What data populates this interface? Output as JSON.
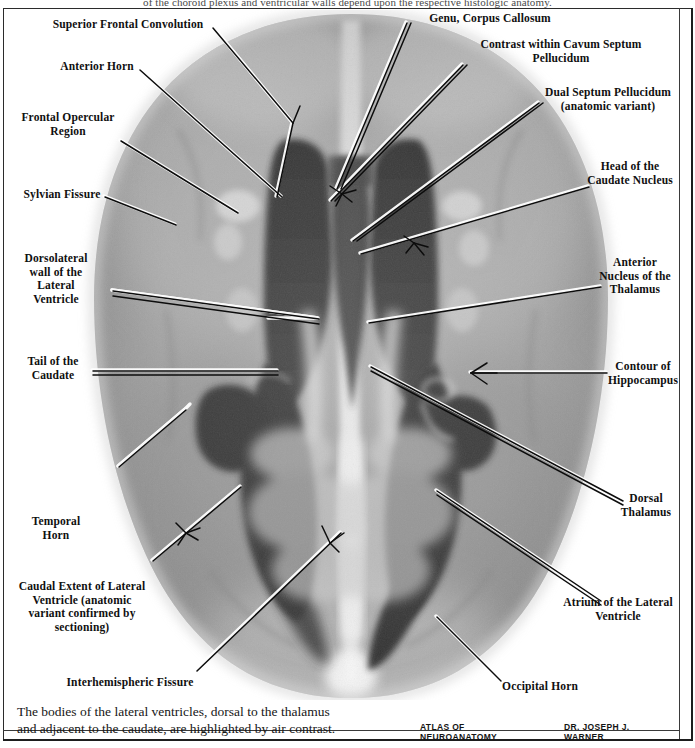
{
  "page": {
    "top_running_text": "of the choroid plexus and ventricular walls depend upon the respective histologic anatomy.",
    "width": 695,
    "height": 748
  },
  "figure": {
    "type": "pneumoencephalogram-axial-brain-radiograph",
    "colors": {
      "background": "#ffffff",
      "brain_parenchyma": "#9a9a9a",
      "ventricle_air": "#2c2c2c",
      "bright_contrast": "#f2f2f2",
      "label_text": "#101010",
      "leader_line": "#0c0c0c",
      "leader_halo": "#ffffff",
      "frame": "#1d1d1d"
    }
  },
  "labels": [
    {
      "id": "superior-frontal-convolution",
      "text": "Superior Frontal Convolution"
    },
    {
      "id": "anterior-horn",
      "text": "Anterior Horn"
    },
    {
      "id": "frontal-opercular-region",
      "text": "Frontal Opercular\nRegion"
    },
    {
      "id": "sylvian-fissure",
      "text": "Sylvian Fissure"
    },
    {
      "id": "dorsolateral-wall",
      "text": "Dorsolateral\nwall of the\nLateral\nVentricle"
    },
    {
      "id": "tail-of-the-caudate",
      "text": "Tail of the\nCaudate"
    },
    {
      "id": "temporal-horn",
      "text": "Temporal\nHorn"
    },
    {
      "id": "caudal-extent-lateral-ventricle",
      "text": "Caudal Extent of Lateral\nVentricle (anatomic\nvariant confirmed by\nsectioning)"
    },
    {
      "id": "interhemispheric-fissure",
      "text": "Interhemispheric  Fissure"
    },
    {
      "id": "genu-corpus-callosum",
      "text": "Genu, Corpus Callosum"
    },
    {
      "id": "contrast-cavum-septum-pellucidum",
      "text": "Contrast within Cavum Septum\nPellucidum"
    },
    {
      "id": "dual-septum-pellucidum",
      "text": "Dual Septum Pellucidum\n(anatomic variant)"
    },
    {
      "id": "head-of-caudate-nucleus",
      "text": "Head of the\nCaudate Nucleus"
    },
    {
      "id": "anterior-nucleus-thalamus",
      "text": "Anterior\nNucleus of the\nThalamus"
    },
    {
      "id": "contour-of-hippocampus",
      "text": "Contour of\nHippocampus"
    },
    {
      "id": "dorsal-thalamus",
      "text": "Dorsal\nThalamus"
    },
    {
      "id": "atrium-of-lateral-ventricle",
      "text": "Atrium of the Lateral\nVentricle"
    },
    {
      "id": "occipital-horn",
      "text": "Occipital Horn"
    }
  ],
  "caption": {
    "line1": "The bodies of the lateral ventricles, dorsal to the thalamus",
    "line2": "and adjacent to the caudate, are highlighted by air contrast."
  },
  "credit": {
    "atlas": "ATLAS OF NEUROANATOMY",
    "author": "DR. JOSEPH J. WARNER"
  }
}
